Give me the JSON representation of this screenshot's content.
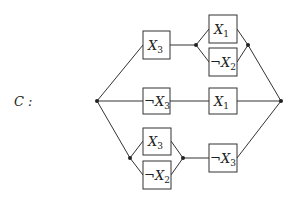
{
  "circuit": {
    "name_label": "C :",
    "gates": [
      {
        "id": "top-x3",
        "neg": "",
        "var": "X",
        "idx": "3"
      },
      {
        "id": "top-x1",
        "neg": "",
        "var": "X",
        "idx": "1"
      },
      {
        "id": "top-not-x2",
        "neg": "¬",
        "var": "X",
        "idx": "2"
      },
      {
        "id": "mid-not-x3",
        "neg": "¬",
        "var": "X",
        "idx": "3"
      },
      {
        "id": "mid-x1",
        "neg": "",
        "var": "X",
        "idx": "1"
      },
      {
        "id": "bot-x3",
        "neg": "",
        "var": "X",
        "idx": "3"
      },
      {
        "id": "bot-not-x2",
        "neg": "¬",
        "var": "X",
        "idx": "2"
      },
      {
        "id": "bot-not-x3",
        "neg": "¬",
        "var": "X",
        "idx": "3"
      }
    ]
  }
}
